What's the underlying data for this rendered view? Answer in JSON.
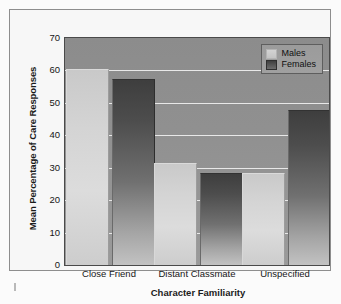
{
  "chart_data": {
    "type": "bar",
    "title": "",
    "xlabel": "Character Familiarity",
    "ylabel": "Mean Percentage of Care Responses",
    "categories": [
      "Close Friend",
      "Distant Classmate",
      "Unspecified"
    ],
    "series": [
      {
        "name": "Males",
        "values": [
          60,
          31,
          28
        ]
      },
      {
        "name": "Females",
        "values": [
          57,
          28,
          47.5
        ]
      }
    ],
    "ylim": [
      0,
      70
    ],
    "yticks": [
      0,
      10,
      20,
      30,
      40,
      50,
      60,
      70
    ],
    "ytick_labels": [
      "0",
      "10",
      "20",
      "30",
      "40",
      "50",
      "60",
      "70"
    ],
    "grid": true,
    "legend_position": "top-right",
    "legend_entries": [
      {
        "label": "Males",
        "swatch": "light-gray"
      },
      {
        "label": "Females",
        "swatch": "dark-gray"
      }
    ],
    "colors": {
      "males_bar": "#d4d4d4",
      "females_bar": "#4d4d4d",
      "plot_background": "#909090",
      "gridline": "#e8e8e8",
      "axis_text": "#161616",
      "frame_border": "#8e8e8e"
    }
  }
}
